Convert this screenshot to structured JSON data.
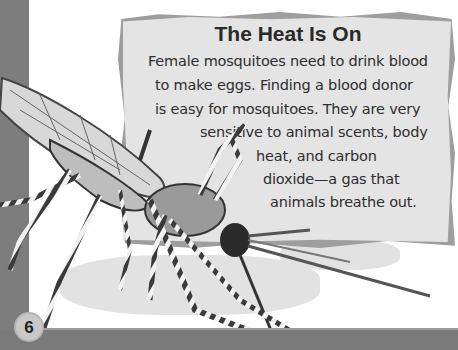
{
  "page": {
    "page_number": "6",
    "colors": {
      "left_strip": "#7d7d7d",
      "bottom_band": "#7a7a7a",
      "textbox_bg": "#e4e4e4",
      "textbox_border": "#9e9e9e",
      "text": "#2e2e2e",
      "background": "#ffffff"
    }
  },
  "sidebar_box": {
    "title": "The Heat Is On",
    "lines": [
      "Female mosquitoes need to drink blood",
      "to make eggs. Finding a blood donor",
      "is easy for mosquitoes. They are very",
      "sensitive to animal scents, body",
      "heat, and carbon",
      "dioxide—a gas that",
      "animals breathe out."
    ]
  },
  "illustration": {
    "subject": "mosquito-illustration"
  }
}
